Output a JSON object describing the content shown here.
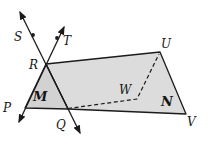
{
  "diagram": {
    "canvas": {
      "width": 208,
      "height": 157,
      "background": "#ffffff"
    },
    "colors": {
      "stroke": "#1b1b1b",
      "plane_n_fill": "#dcdcdc",
      "plane_m_fill": "#d2d2d2",
      "label": "#161616"
    },
    "planes": [
      {
        "name": "plane-N-surface",
        "label": "N",
        "points": "46,64 160,52 186,114 68,109",
        "fill_key": "plane_n_fill"
      },
      {
        "name": "plane-M-surface",
        "label": "M",
        "points": "46,64 25,108 68,109",
        "fill_key": "plane_m_fill"
      }
    ],
    "arrow_lines": [
      {
        "name": "line-through-S-R-Q",
        "x1": 20,
        "y1": 12,
        "x2": 80,
        "y2": 133
      },
      {
        "name": "line-through-T-R-P",
        "x1": 64,
        "y1": 27,
        "x2": 19,
        "y2": 122
      }
    ],
    "dashed_path": {
      "name": "dashed-segments-Q-W-U",
      "points": "68,108.5 137,99 159,54"
    },
    "point_dots": [
      {
        "name": "point-S-dot",
        "x": 33,
        "y": 35
      },
      {
        "name": "point-T-dot",
        "x": 57,
        "y": 38
      }
    ],
    "labels": [
      {
        "name": "label-S",
        "text": "S",
        "x": 14,
        "y": 41,
        "kind": "point"
      },
      {
        "name": "label-T",
        "text": "T",
        "x": 63,
        "y": 45,
        "kind": "point"
      },
      {
        "name": "label-R",
        "text": "R",
        "x": 29,
        "y": 69,
        "kind": "point"
      },
      {
        "name": "label-P",
        "text": "P",
        "x": 3,
        "y": 112,
        "kind": "point"
      },
      {
        "name": "label-Q",
        "text": "Q",
        "x": 56,
        "y": 129,
        "kind": "point"
      },
      {
        "name": "label-U",
        "text": "U",
        "x": 161,
        "y": 48,
        "kind": "point"
      },
      {
        "name": "label-V",
        "text": "V",
        "x": 187,
        "y": 126,
        "kind": "point"
      },
      {
        "name": "label-W",
        "text": "W",
        "x": 119,
        "y": 94,
        "kind": "point"
      },
      {
        "name": "label-plane-M",
        "text": "M",
        "x": 33,
        "y": 101,
        "kind": "plane"
      },
      {
        "name": "label-plane-N",
        "text": "N",
        "x": 161,
        "y": 106,
        "kind": "plane"
      }
    ]
  }
}
